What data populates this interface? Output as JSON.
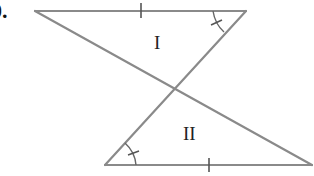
{
  "problem": {
    "number_label": "0."
  },
  "figure": {
    "colors": {
      "line": "#8a8a8a",
      "tick": "#555555",
      "label": "#222222",
      "background": "#ffffff"
    },
    "triangles": [
      {
        "label": "I"
      },
      {
        "label": "II"
      }
    ],
    "marks": {
      "congruent_sides": "single-tick",
      "congruent_angles": "single-arc-with-tick"
    }
  }
}
